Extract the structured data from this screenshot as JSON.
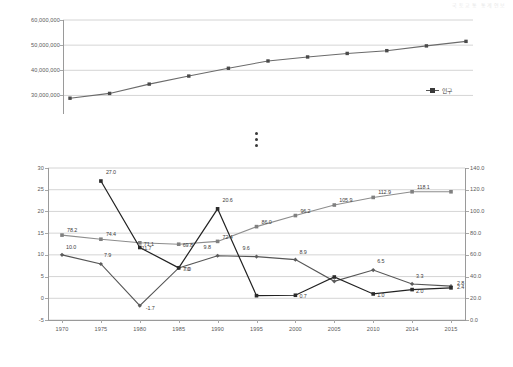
{
  "page": {
    "header_faint": "국토교통 통계연보"
  },
  "chart_data": [
    {
      "type": "line",
      "title": "",
      "id": "population-chart",
      "xlabel": "",
      "ylabel": "",
      "ylim": [
        25000000,
        60000000
      ],
      "yticks": [
        "30,000,000",
        "40,000,000",
        "50,000,000",
        "60,000,000"
      ],
      "ytick_values": [
        30000000,
        40000000,
        50000000,
        60000000
      ],
      "grid": true,
      "legend_position": "right",
      "categories": [
        "1970",
        "1975",
        "1980",
        "1985",
        "1990",
        "1995",
        "2000",
        "2005",
        "2010",
        "2014",
        "2015"
      ],
      "series": [
        {
          "name": "인구",
          "marker": "square",
          "color": "#6b6b6b",
          "values": [
            28900000,
            30800000,
            34500000,
            37700000,
            40800000,
            43700000,
            45300000,
            46700000,
            47800000,
            49700000,
            51500000
          ]
        }
      ]
    },
    {
      "type": "line",
      "title": "",
      "id": "economy-chart",
      "xlabel": "",
      "ylabel_left": "",
      "ylabel_right": "",
      "ylim_left": [
        -5,
        30
      ],
      "ylim_right": [
        0.0,
        140.0
      ],
      "yticks_left": [
        "-5",
        "0",
        "5",
        "10",
        "15",
        "20",
        "25",
        "30"
      ],
      "ytick_values_left": [
        -5,
        0,
        5,
        10,
        15,
        20,
        25,
        30
      ],
      "yticks_right": [
        "0.0",
        "20.0",
        "40.0",
        "60.0",
        "80.0",
        "100.0",
        "120.0",
        "140.0"
      ],
      "ytick_values_right": [
        0,
        20,
        40,
        60,
        80,
        100,
        120,
        140
      ],
      "grid": true,
      "legend_position": "right-inside",
      "categories": [
        "1970",
        "1975",
        "1980",
        "1985",
        "1990",
        "1995",
        "2000",
        "2005",
        "2010",
        "2014",
        "2015"
      ],
      "series": [
        {
          "name": "경제성장률",
          "axis": "left",
          "marker": "diamond",
          "color": "#5c5c5c",
          "values": [
            10.0,
            7.9,
            -1.7,
            7.0,
            9.8,
            9.6,
            8.9,
            3.9,
            6.5,
            3.3,
            2.8
          ],
          "labels": [
            "10.0",
            "7.9",
            "-1.7",
            "7.0",
            "9.8",
            "9.6",
            "8.9",
            "",
            "6.5",
            "3.3",
            "2.8"
          ]
        },
        {
          "name": "지가변동률",
          "axis": "left",
          "marker": "square",
          "color": "#2b2b2b",
          "values": [
            null,
            27.0,
            11.7,
            7.0,
            20.6,
            0.6,
            0.7,
            4.9,
            1.0,
            2.0,
            2.4
          ],
          "labels": [
            "",
            "27.0",
            "11.7",
            "7.0",
            "20.6",
            "",
            "0.7",
            "",
            "1.0",
            "2.0",
            "2.4"
          ]
        },
        {
          "name": "주택보급률",
          "axis": "right",
          "marker": "square",
          "color": "#808080",
          "values": [
            78.2,
            74.4,
            71.1,
            69.8,
            72.4,
            86.0,
            96.2,
            105.9,
            112.9,
            118.1,
            118.1
          ],
          "labels": [
            "78.2",
            "74.4",
            "71.1",
            "69.8",
            "72.4",
            "86.0",
            "96.2",
            "105.9",
            "112.9",
            "118.1",
            ""
          ]
        }
      ]
    }
  ]
}
